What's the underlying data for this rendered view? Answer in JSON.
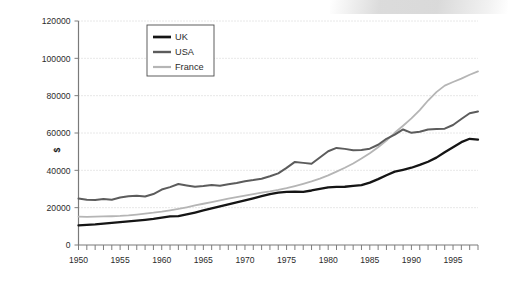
{
  "chart_data": {
    "type": "line",
    "title": "",
    "xlabel": "",
    "ylabel": "$",
    "xlim": [
      1950,
      1998
    ],
    "ylim": [
      0,
      120000
    ],
    "grid": true,
    "legend_position": "top-left-inside",
    "y_ticks": [
      "0",
      "20000",
      "40000",
      "60000",
      "80000",
      "100000",
      "120000"
    ],
    "y_tick_values": [
      0,
      20000,
      40000,
      60000,
      80000,
      100000,
      120000
    ],
    "x_ticks": [
      "1950",
      "1955",
      "1960",
      "1965",
      "1970",
      "1975",
      "1980",
      "1985",
      "1990",
      "1995"
    ],
    "x_tick_values": [
      1950,
      1955,
      1960,
      1965,
      1970,
      1975,
      1980,
      1985,
      1990,
      1995
    ],
    "x": [
      1950,
      1951,
      1952,
      1953,
      1954,
      1955,
      1956,
      1957,
      1958,
      1959,
      1960,
      1961,
      1962,
      1963,
      1964,
      1965,
      1966,
      1967,
      1968,
      1969,
      1970,
      1971,
      1972,
      1973,
      1974,
      1975,
      1976,
      1977,
      1978,
      1979,
      1980,
      1981,
      1982,
      1983,
      1984,
      1985,
      1986,
      1987,
      1988,
      1989,
      1990,
      1991,
      1992,
      1993,
      1994,
      1995,
      1996,
      1997,
      1998
    ],
    "series": [
      {
        "name": "UK",
        "color": "#151515",
        "width": 2.3,
        "values": [
          10500,
          10800,
          11100,
          11500,
          11900,
          12300,
          12700,
          13100,
          13500,
          14000,
          14700,
          15300,
          15500,
          16400,
          17400,
          18500,
          19600,
          20700,
          21800,
          22800,
          23900,
          25000,
          26200,
          27300,
          28100,
          28500,
          28600,
          28500,
          29200,
          30100,
          30900,
          31100,
          31200,
          31700,
          32100,
          33400,
          35300,
          37400,
          39300,
          40300,
          41400,
          42900,
          44600,
          46800,
          49700,
          52400,
          55100,
          56900,
          56500
        ]
      },
      {
        "name": "USA",
        "color": "#5c5c5c",
        "width": 2.0,
        "values": [
          24900,
          24300,
          24100,
          24700,
          24200,
          25400,
          26100,
          26400,
          26000,
          27300,
          29700,
          31000,
          32700,
          31900,
          31200,
          31600,
          32200,
          31800,
          32500,
          33200,
          34200,
          34800,
          35500,
          36800,
          38400,
          41300,
          44500,
          44000,
          43500,
          46900,
          50200,
          52000,
          51500,
          50800,
          50900,
          51600,
          53700,
          56900,
          59100,
          61900,
          60100,
          60700,
          61900,
          62100,
          62300,
          64300,
          67500,
          70600,
          71500
        ]
      },
      {
        "name": "France",
        "color": "#b5b5b5",
        "width": 1.8,
        "values": [
          15200,
          15100,
          15200,
          15300,
          15400,
          15600,
          15900,
          16300,
          16800,
          17300,
          17900,
          18600,
          19300,
          20200,
          21200,
          22100,
          23000,
          23900,
          24800,
          25700,
          26500,
          27300,
          28000,
          28700,
          29500,
          30500,
          31600,
          32800,
          34100,
          35600,
          37300,
          39300,
          41400,
          43700,
          46300,
          49200,
          52400,
          56000,
          60100,
          63900,
          67800,
          72300,
          77400,
          81900,
          85400,
          87300,
          89100,
          91200,
          93000
        ]
      }
    ],
    "annotations": []
  },
  "legend": {
    "items": [
      {
        "label": "UK"
      },
      {
        "label": "USA"
      },
      {
        "label": "France"
      }
    ]
  },
  "axes": {
    "y_axis_title": "$"
  }
}
